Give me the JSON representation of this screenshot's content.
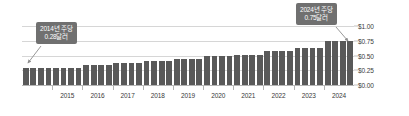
{
  "chart_data": {
    "type": "bar",
    "title": "",
    "subtitle": "",
    "xlabel": "",
    "ylabel": "",
    "ylim": [
      0,
      1.0
    ],
    "ytick_values": [
      0.0,
      0.25,
      0.5,
      0.75,
      1.0
    ],
    "ytick_labels": [
      "$0.00",
      "$0.25",
      "$0.50",
      "$0.75",
      "$1.00"
    ],
    "yaxis_position": "right",
    "grid": true,
    "legend": null,
    "categories": [
      "2014 Q1",
      "2014 Q2",
      "2014 Q3",
      "2014 Q4",
      "2015 Q1",
      "2015 Q2",
      "2015 Q3",
      "2015 Q4",
      "2016 Q1",
      "2016 Q2",
      "2016 Q3",
      "2016 Q4",
      "2017 Q1",
      "2017 Q2",
      "2017 Q3",
      "2017 Q4",
      "2018 Q1",
      "2018 Q2",
      "2018 Q3",
      "2018 Q4",
      "2019 Q1",
      "2019 Q2",
      "2019 Q3",
      "2019 Q4",
      "2020 Q1",
      "2020 Q2",
      "2020 Q3",
      "2020 Q4",
      "2021 Q1",
      "2021 Q2",
      "2021 Q3",
      "2021 Q4",
      "2022 Q1",
      "2022 Q2",
      "2022 Q3",
      "2022 Q4",
      "2023 Q1",
      "2023 Q2",
      "2023 Q3",
      "2023 Q4",
      "2024 Q1",
      "2024 Q2",
      "2024 Q3",
      "2024 Q4"
    ],
    "values": [
      0.28,
      0.28,
      0.28,
      0.28,
      0.29,
      0.29,
      0.29,
      0.29,
      0.34,
      0.34,
      0.34,
      0.34,
      0.37,
      0.37,
      0.37,
      0.37,
      0.4,
      0.4,
      0.4,
      0.4,
      0.44,
      0.44,
      0.44,
      0.44,
      0.49,
      0.49,
      0.49,
      0.49,
      0.51,
      0.51,
      0.51,
      0.51,
      0.58,
      0.58,
      0.58,
      0.58,
      0.62,
      0.62,
      0.62,
      0.62,
      0.74,
      0.75,
      0.75,
      0.75
    ],
    "xtick_labels": [
      "2015",
      "2016",
      "2017",
      "2018",
      "2019",
      "2020",
      "2021",
      "2022",
      "2023",
      "2024"
    ],
    "bar_color": "#595959",
    "annotations": [
      {
        "id": "callout-2014",
        "line1": "2014년 주당",
        "line2": "0.28달러",
        "value": 0.28,
        "target_category": "2014 Q1"
      },
      {
        "id": "callout-2024",
        "line1": "2024년 주당",
        "line2": "0.75달러",
        "value": 0.75,
        "target_category": "2024 Q3"
      }
    ]
  },
  "colors": {
    "bar": "#595959",
    "gridline": "#d6d6d6",
    "axis": "#b5b5b5",
    "callout_bg": "#707070",
    "callout_text": "#ffffff",
    "tick_text": "#3a3a3a",
    "background": "#ffffff"
  }
}
